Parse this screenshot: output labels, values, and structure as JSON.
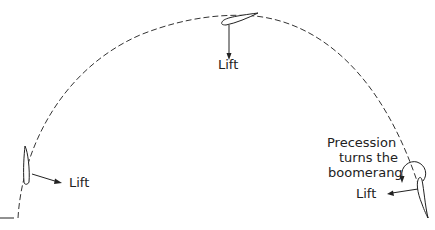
{
  "diagram": {
    "labels": {
      "top_lift": "Lift",
      "left_lift": "Lift",
      "right_lift": "Lift",
      "precession_line1": "Precession",
      "precession_line2": "turns the",
      "precession_line3": "boomerang"
    },
    "colors": {
      "stroke": "#222222",
      "background": "#ffffff"
    }
  }
}
